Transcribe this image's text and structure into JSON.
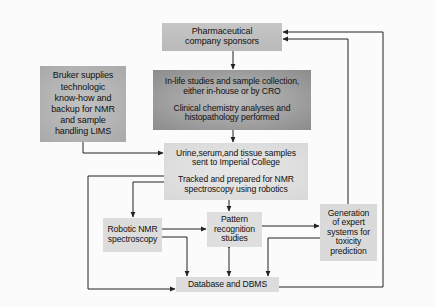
{
  "diagram": {
    "type": "flowchart",
    "nodes": {
      "pharma": {
        "lines": [
          "Pharmaceutical",
          "company sponsors"
        ]
      },
      "bruker": {
        "lines": [
          "Bruker supplies",
          "technologic",
          "know-how and",
          "backup for NMR",
          "and sample",
          "handling LIMS"
        ]
      },
      "inlife": {
        "para1": [
          "In-life studies and sample collection,",
          "either in-house or by CRO"
        ],
        "para2": [
          "Clinical chemistry analyses and",
          "histopathology performed"
        ]
      },
      "urine": {
        "para1": [
          "Urine,serum,and tissue samples",
          "sent to Imperial College"
        ],
        "para2": [
          "Tracked and prepared for NMR",
          "spectroscopy using robotics"
        ]
      },
      "robotic": {
        "lines": [
          "Robotic NMR",
          "spectroscopy"
        ]
      },
      "pattern": {
        "lines": [
          "Pattern",
          "recognition",
          "studies"
        ]
      },
      "generation": {
        "lines": [
          "Generation",
          "of expert",
          "systems for",
          "toxicity",
          "prediction"
        ]
      },
      "database": {
        "lines": [
          "Database and DBMS"
        ]
      }
    },
    "edges": [
      {
        "from": "pharma",
        "to": "inlife"
      },
      {
        "from": "inlife",
        "to": "urine"
      },
      {
        "from": "bruker",
        "to": "urine"
      },
      {
        "from": "urine",
        "to": "robotic"
      },
      {
        "from": "urine",
        "to": "pattern"
      },
      {
        "from": "urine",
        "to": "database"
      },
      {
        "from": "robotic",
        "to": "pattern"
      },
      {
        "from": "robotic",
        "to": "database"
      },
      {
        "from": "pattern",
        "to": "database",
        "bidirectional": true
      },
      {
        "from": "pattern",
        "to": "generation"
      },
      {
        "from": "generation",
        "to": "database"
      },
      {
        "from": "generation",
        "to": "pharma"
      },
      {
        "from": "database",
        "to": "pharma"
      }
    ],
    "colors": {
      "line": "#222222",
      "background": "#fbfbfb",
      "dark_box": "#9a9a9a",
      "mid_box": "#b9b9b9",
      "light_box": "#dcdcdc"
    }
  }
}
